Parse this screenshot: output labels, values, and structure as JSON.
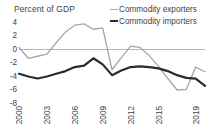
{
  "chart_data": {
    "type": "line",
    "title": "",
    "ylabel": "Percent of GDP",
    "xlabel": "",
    "ylim": [
      -8,
      4
    ],
    "yticks": [
      4,
      2,
      0,
      -2,
      -4,
      -6,
      -8
    ],
    "ytick_labels": [
      "4",
      "2",
      "0",
      "-2",
      "-4",
      "-6",
      "-8"
    ],
    "xlim": [
      2000,
      2020
    ],
    "xticks": [
      2000,
      2003,
      2006,
      2009,
      2012,
      2015,
      2019
    ],
    "xtick_labels": [
      "2000",
      "2003",
      "2006",
      "2009",
      "2012",
      "2015",
      "2019"
    ],
    "grid": false,
    "zero_line": true,
    "legend_position": "top-right",
    "x": [
      2000,
      2001,
      2002,
      2003,
      2004,
      2005,
      2006,
      2007,
      2008,
      2009,
      2010,
      2011,
      2012,
      2013,
      2014,
      2015,
      2016,
      2017,
      2018,
      2019,
      2020
    ],
    "series": [
      {
        "name": "Commodity exporters",
        "color": "#a6a6a6",
        "width": 1.3,
        "values": [
          0.3,
          -1.3,
          -1.0,
          -0.7,
          1.0,
          2.6,
          3.6,
          3.8,
          3.0,
          3.2,
          -3.0,
          -1.2,
          0.5,
          0.3,
          -0.9,
          -2.5,
          -4.3,
          -6.0,
          -5.9,
          -2.6,
          -3.3
        ]
      },
      {
        "name": "Commodity importers",
        "color": "#2b2b2b",
        "width": 2.2,
        "values": [
          -3.6,
          -4.0,
          -4.3,
          -4.0,
          -3.6,
          -3.2,
          -2.6,
          -2.4,
          -1.3,
          -2.2,
          -3.8,
          -3.1,
          -2.6,
          -2.5,
          -2.6,
          -2.8,
          -3.2,
          -3.8,
          -4.2,
          -4.3,
          -5.4
        ]
      }
    ]
  },
  "legend": {
    "items": [
      {
        "label": "Commodity exporters",
        "key": "exporters"
      },
      {
        "label": "Commodity importers",
        "key": "importers"
      }
    ]
  },
  "axis": {
    "y_title": "Percent of GDP"
  },
  "colors": {
    "exporters": "#a6a6a6",
    "importers": "#2b2b2b",
    "zero_line": "#b5b5b5",
    "text": "#3f3f3f",
    "background": "#ffffff"
  }
}
